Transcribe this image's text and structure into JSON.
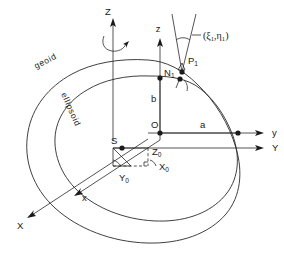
{
  "figure": {
    "type": "geodetic-reference-diagram",
    "background_color": "#ffffff",
    "line_color": "#2a2a2a"
  },
  "curves": [
    {
      "name": "geoid",
      "label": "geoid"
    },
    {
      "name": "ellipsoid",
      "label": "ellipsoid"
    }
  ],
  "axes": {
    "geocentric": [
      {
        "name": "Z-axis",
        "label": "Z"
      },
      {
        "name": "Y-axis",
        "label": "Y"
      },
      {
        "name": "X-axis",
        "label": "X"
      }
    ],
    "ellipsoidal": [
      {
        "name": "z-axis",
        "label": "z"
      },
      {
        "name": "y-axis",
        "label": "y"
      },
      {
        "name": "x-axis",
        "label": "x"
      }
    ],
    "rotation_arrow": "rotation-arrow"
  },
  "points": [
    {
      "name": "geocenter",
      "label": "O"
    },
    {
      "name": "ellipsoid-center",
      "label": "S"
    },
    {
      "name": "surface-point",
      "label": "P",
      "sub": "1"
    },
    {
      "name": "geoid-point",
      "label": "N",
      "sub": "1"
    }
  ],
  "dimensions": [
    {
      "name": "semi-major-axis",
      "label": "a"
    },
    {
      "name": "semi-minor-axis",
      "label": "b"
    }
  ],
  "datum_shift": [
    {
      "name": "shift-x",
      "label": "X",
      "sub": "0"
    },
    {
      "name": "shift-y",
      "label": "Y",
      "sub": "0"
    },
    {
      "name": "shift-z",
      "label": "Z",
      "sub": "0"
    }
  ],
  "deflection": {
    "name": "deflection-of-vertical",
    "open_paren": "(",
    "xi": "ξ",
    "xi_sub": "1",
    "comma": ",",
    "eta": "η",
    "eta_sub": "1",
    "close_paren": ")"
  }
}
